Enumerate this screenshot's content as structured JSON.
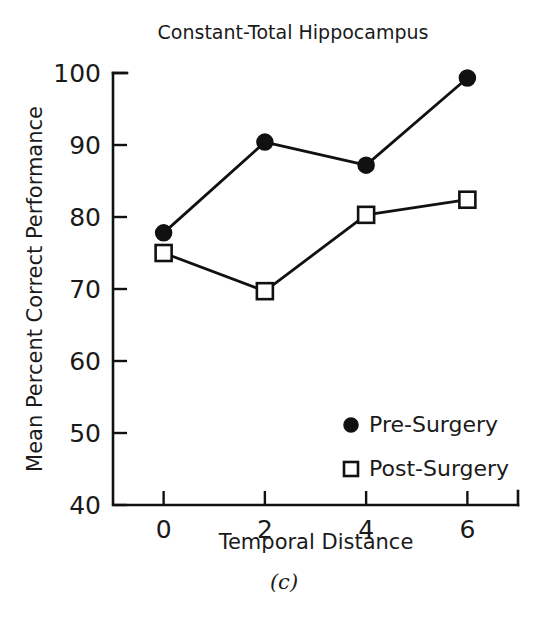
{
  "figure": {
    "caption": "(c)",
    "background_color": "#ffffff",
    "ink_color": "#111111"
  },
  "chart_data": {
    "type": "line",
    "title": "Constant-Total Hippocampus",
    "xlabel": "Temporal Distance",
    "ylabel": "Mean Percent Correct Performance",
    "x": [
      0,
      2,
      4,
      6
    ],
    "xtick_labels": [
      "0",
      "2",
      "4",
      "6"
    ],
    "ytick_labels": [
      "40",
      "50",
      "60",
      "70",
      "80",
      "90",
      "100"
    ],
    "yticks": [
      40,
      50,
      60,
      70,
      80,
      90,
      100
    ],
    "xlim": [
      -1,
      7
    ],
    "ylim": [
      40,
      100
    ],
    "grid": false,
    "legend_position": "lower right inside",
    "series": [
      {
        "name": "Pre-Surgery",
        "marker": "filled-circle",
        "values": [
          77.8,
          90.4,
          87.2,
          99.3
        ]
      },
      {
        "name": "Post-Surgery",
        "marker": "open-square",
        "values": [
          75.0,
          69.7,
          80.3,
          82.4
        ]
      }
    ]
  }
}
